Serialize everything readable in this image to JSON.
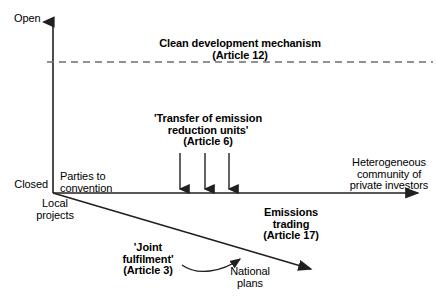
{
  "diagram": {
    "type": "conceptual-axis-diagram",
    "colors": {
      "line": "#231f20",
      "text": "#000000",
      "background": "#ffffff"
    },
    "axes": {
      "y_axis": {
        "top_label": "Open",
        "bottom_label": "Closed",
        "orientation": "vertical",
        "arrow": "up"
      },
      "x_axis": {
        "left_label": "Parties to\nconvention",
        "right_label": "Heterogeneous\ncommunity of\nprivate investors",
        "orientation": "horizontal",
        "arrow": "right"
      },
      "diagonal_axis": {
        "start_label": "Local\nprojects",
        "end_label": "National\nplans",
        "orientation": "descending-diagonal",
        "arrow": "down-right"
      }
    },
    "labels": {
      "cdm": "Clean development mechanism\n(Article 12)",
      "transfer": "'Transfer of emission\nreduction units'\n(Article 6)",
      "emissions_trading": "Emissions\ntrading\n(Article 17)",
      "joint_fulfilment": "'Joint\nfulfilment'\n(Article 3)",
      "national_plans": "National\nplans",
      "local_projects": "Local\nprojects",
      "parties_to_convention": "Parties to\nconvention",
      "heterogeneous": "Heterogeneous\ncommunity of\nprivate investors",
      "open": "Open",
      "closed": "Closed"
    },
    "markers": {
      "down_arrow_count": 3,
      "dashed_line": "horizontal dashed reference line at Clean development mechanism level",
      "curved_arrow": "curved connector from 'Joint fulfilment' to National plans"
    }
  }
}
